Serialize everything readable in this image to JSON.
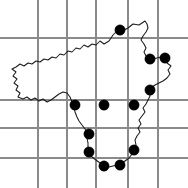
{
  "figure": {
    "type": "distribution-dot-map",
    "title": "",
    "width": 188,
    "height": 188,
    "background_color": "#ffffff"
  },
  "chart_data": {
    "type": "scatter",
    "title": "",
    "xlabel": "",
    "ylabel": "",
    "xlim": [
      0,
      188
    ],
    "ylim": [
      188,
      0
    ],
    "grid": true,
    "legend": null,
    "series": [
      {
        "name": "occurrence-records",
        "marker": "filled-circle",
        "color": "#000000",
        "radius": 5.2,
        "points": [
          {
            "x": 120,
            "y": 30
          },
          {
            "x": 150,
            "y": 59
          },
          {
            "x": 165,
            "y": 58
          },
          {
            "x": 150,
            "y": 90
          },
          {
            "x": 75,
            "y": 105
          },
          {
            "x": 104,
            "y": 105
          },
          {
            "x": 134,
            "y": 105
          },
          {
            "x": 89,
            "y": 134
          },
          {
            "x": 89,
            "y": 152
          },
          {
            "x": 134,
            "y": 150
          },
          {
            "x": 104,
            "y": 166
          },
          {
            "x": 120,
            "y": 165
          }
        ]
      }
    ],
    "gridlines": {
      "color": "#8a8a8a",
      "vertical_x": [
        38,
        67,
        96,
        128,
        158
      ],
      "horizontal_y": [
        38,
        100,
        128,
        158
      ]
    },
    "region_outline": {
      "name": "region-boundary",
      "color": "#1a1a1a",
      "closed": true,
      "path": "M 145,21 L 139,25 L 133,24 L 128,28 L 122,31 L 117,31 L 113,35 L 109,41 L 104,44 L 100,41 L 96,45 L 92,44 L 88,47 L 84,45 L 80,49 L 76,48 L 72,52 L 68,51 L 64,55 L 60,54 L 56,58 L 52,57 L 48,60 L 44,59 L 40,62 L 36,61 L 32,64 L 28,63 L 24,66 L 20,64 L 16,67 L 12,69 L 16,72 L 13,76 L 17,79 L 14,83 L 18,86 L 16,90 L 20,93 L 18,97 L 23,99 L 27,97 L 31,100 L 35,98 L 39,101 L 43,99 L 47,102 L 51,100 L 55,97 L 59,94 L 63,92 L 67,93 L 70,97 L 72,102 L 74,107 L 75,112 L 77,117 L 79,121 L 82,125 L 85,129 L 88,133 L 87,138 L 88,143 L 88,148 L 89,153 L 92,157 L 96,160 L 100,163 L 104,166 L 109,167 L 113,166 L 117,165 L 121,164 L 125,161 L 129,158 L 132,154 L 134,150 L 136,145 L 135,140 L 137,136 L 140,132 L 138,128 L 141,124 L 139,120 L 142,116 L 145,112 L 143,108 L 146,104 L 148,100 L 150,96 L 149,92 L 151,88 L 155,85 L 159,83 L 163,81 L 167,78 L 170,74 L 168,70 L 171,66 L 167,63 L 165,59 L 161,57 L 157,58 L 153,59 L 149,59 L 146,56 L 144,52 L 146,48 L 144,44 L 141,40 L 143,36 L 146,32 L 148,28 L 147,24 Z"
    }
  },
  "accessibility": {
    "description": "Dot distribution map showing twelve filled black circular record markers within an irregular regional outline overlaid on a rectangular grid."
  }
}
